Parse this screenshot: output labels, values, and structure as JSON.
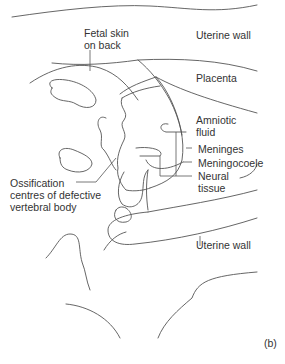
{
  "figure": {
    "panel_label": "(b)",
    "colors": {
      "stroke": "#555555",
      "text": "#333333",
      "background": "#ffffff"
    },
    "labels": {
      "uterine_wall_top": "Uterine wall",
      "fetal_skin_line1": "Fetal skin",
      "fetal_skin_line2": "on back",
      "placenta": "Placenta",
      "amniotic_line1": "Amniotic",
      "amniotic_line2": "fluid",
      "meninges": "Meninges",
      "meningocoele": "Meningocoele",
      "neural_line1": "Neural",
      "neural_line2": "tissue",
      "ossification_line1": "Ossification",
      "ossification_line2": "centres of defective",
      "ossification_line3": "vertebral body",
      "uterine_wall_bottom": "Uterine wall"
    }
  }
}
